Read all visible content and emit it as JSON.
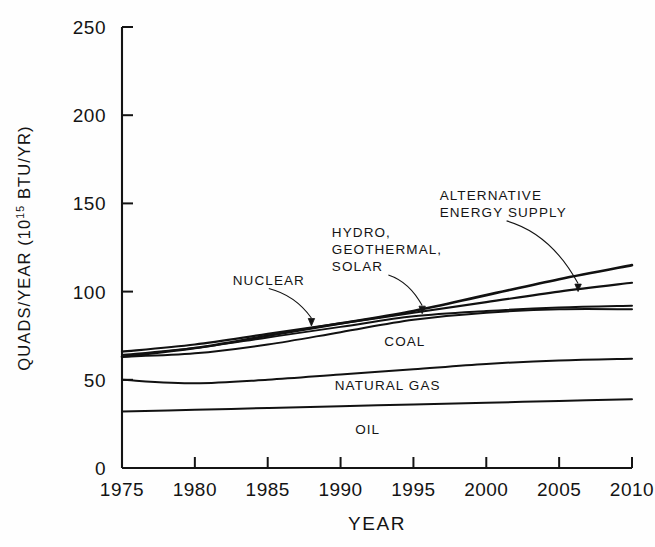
{
  "chart_data": {
    "type": "line",
    "title": "",
    "xlabel": "YEAR",
    "ylabel": "QUADS/YEAR (10¹⁵ BTU/YR)",
    "ylabel_main": "QUADS/YEAR (10",
    "ylabel_sup": "15",
    "ylabel_tail": " BTU/YR)",
    "xlim": [
      1975,
      2010
    ],
    "ylim": [
      0,
      250
    ],
    "yticks": [
      0,
      50,
      100,
      150,
      200,
      250
    ],
    "ytick_labels": [
      "0",
      "50",
      "100",
      "150",
      "200",
      "250"
    ],
    "xticks": [
      1975,
      1980,
      1985,
      1990,
      1995,
      2000,
      2005,
      2010
    ],
    "xtick_labels": [
      "1975",
      "1980",
      "1985",
      "1990",
      "1995",
      "2000",
      "2005",
      "2010"
    ],
    "grid": false,
    "legend_position": "inline-annotations",
    "x": [
      1975,
      1980,
      1985,
      1990,
      1995,
      2000,
      2005,
      2010
    ],
    "series": [
      {
        "name": "ALTERNATIVE ENERGY SUPPLY",
        "values": [
          63,
          68,
          75,
          82,
          89,
          98,
          107,
          115
        ],
        "color": "#111111",
        "width": 2.6
      },
      {
        "name": "HYDRO, GEOTHERMAL, SOLAR",
        "values": [
          66,
          70,
          76,
          82,
          88,
          94,
          100,
          105
        ],
        "color": "#111111",
        "width": 2.2
      },
      {
        "name": "NUCLEAR",
        "values": [
          64,
          68,
          74,
          80,
          86,
          89,
          91,
          92
        ],
        "color": "#111111",
        "width": 2.0
      },
      {
        "name": "COAL",
        "values": [
          63,
          65,
          70,
          77,
          84,
          88,
          90,
          90
        ],
        "color": "#111111",
        "width": 2.0
      },
      {
        "name": "NATURAL GAS",
        "values": [
          50,
          48,
          50,
          53,
          56,
          59,
          61,
          62
        ],
        "color": "#111111",
        "width": 2.0
      },
      {
        "name": "OIL",
        "values": [
          32,
          33,
          34,
          35,
          36,
          37,
          38,
          39
        ],
        "color": "#111111",
        "width": 2.0
      }
    ],
    "annotations": [
      {
        "text": "NUCLEAR",
        "lines": [
          "NUCLEAR"
        ],
        "x": 1982.6,
        "y": 104,
        "points_to": [
          1988.0,
          80.5
        ]
      },
      {
        "text": "HYDRO, GEOTHERMAL, SOLAR",
        "lines": [
          "HYDRO,",
          "GEOTHERMAL,",
          "SOLAR"
        ],
        "x": 1989.4,
        "y": 131,
        "points_to": [
          1995.6,
          87.5
        ]
      },
      {
        "text": "ALTERNATIVE ENERGY SUPPLY",
        "lines": [
          "ALTERNATIVE",
          "ENERGY SUPPLY"
        ],
        "x": 1996.8,
        "y": 152,
        "points_to": [
          2006.3,
          100.0
        ]
      },
      {
        "text": "COAL",
        "lines": [
          "COAL"
        ],
        "x": 1993.0,
        "y": 69,
        "points_to": null
      },
      {
        "text": "NATURAL GAS",
        "lines": [
          "NATURAL GAS"
        ],
        "x": 1989.6,
        "y": 44,
        "points_to": null
      },
      {
        "text": "OIL",
        "lines": [
          "OIL"
        ],
        "x": 1991.0,
        "y": 19,
        "points_to": null
      }
    ]
  }
}
